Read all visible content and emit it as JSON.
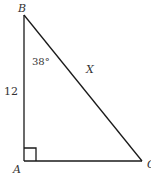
{
  "diagram": {
    "type": "right-triangle",
    "vertices": {
      "B": {
        "label": "B",
        "x": 24,
        "y": 15
      },
      "A": {
        "label": "A",
        "x": 24,
        "y": 161
      },
      "C": {
        "label": "C",
        "x": 142,
        "y": 161
      }
    },
    "right_angle_at": "A",
    "labels": {
      "side_AB": "12",
      "angle_B": "38°",
      "hypotenuse_BC": "X"
    },
    "colors": {
      "stroke": "#1a1a1a",
      "text": "#333333",
      "background": "#ffffff"
    }
  }
}
